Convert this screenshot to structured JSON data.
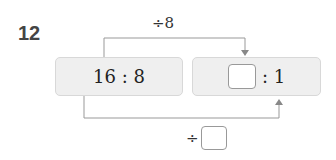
{
  "problem": {
    "number": "12",
    "top_operation": "÷8",
    "bottom_operation_symbol": "÷",
    "left_ratio": "16 : 8",
    "right_ratio_suffix": ": 1",
    "colors": {
      "box_bg": "#efefef",
      "line": "#999999"
    }
  }
}
